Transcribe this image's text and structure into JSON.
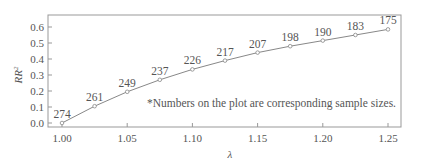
{
  "chart_data": {
    "type": "line",
    "title": "",
    "xlabel": "λ",
    "ylabel": "RR²",
    "x": [
      1.0,
      1.025,
      1.05,
      1.075,
      1.1,
      1.125,
      1.15,
      1.175,
      1.2,
      1.225,
      1.25
    ],
    "series": [
      {
        "name": "RR²",
        "values": [
          0.0,
          0.105,
          0.195,
          0.27,
          0.335,
          0.39,
          0.44,
          0.48,
          0.515,
          0.55,
          0.585
        ],
        "point_labels": [
          "274",
          "261",
          "249",
          "237",
          "226",
          "217",
          "207",
          "198",
          "190",
          "183",
          "175"
        ]
      }
    ],
    "xticks": [
      "1.00",
      "1.05",
      "1.10",
      "1.15",
      "1.20",
      "1.25"
    ],
    "yticks": [
      "0.0",
      "0.1",
      "0.2",
      "0.3",
      "0.4",
      "0.5",
      "0.6"
    ],
    "xlim": [
      0.993,
      1.258
    ],
    "ylim": [
      -0.025,
      0.67
    ],
    "grid": false,
    "annotation": "*Numbers on the plot are corresponding sample sizes."
  },
  "colors": {
    "line": "#888888",
    "frame": "#999999",
    "text": "#555555"
  }
}
